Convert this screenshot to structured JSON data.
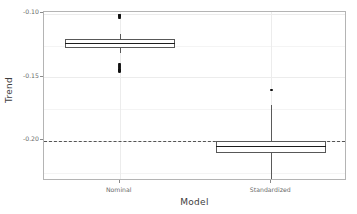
{
  "chart_data": {
    "type": "box",
    "title": "",
    "xlabel": "Model",
    "ylabel": "Trend",
    "categories": [
      "Nominal",
      "Standardized"
    ],
    "ylim": [
      -0.2315,
      -0.0985
    ],
    "yticks": [
      -0.1,
      -0.15,
      -0.2
    ],
    "ytick_labels": [
      "-0.10",
      "-0.15",
      "-0.20"
    ],
    "grid": true,
    "legend": "none",
    "reference_line": {
      "value": -0.2,
      "style": "dashed",
      "color": "#545454"
    },
    "boxes": [
      {
        "category": "Nominal",
        "lower_whisker": -0.1305,
        "q1": -0.1268,
        "median": -0.1233,
        "q3": -0.1195,
        "upper_whisker": -0.1155,
        "outliers": [
          -0.1008,
          -0.1012,
          -0.1018,
          -0.1025,
          -0.1032,
          -0.1395,
          -0.1402,
          -0.141,
          -0.1418,
          -0.1425,
          -0.1438,
          -0.1445,
          -0.1452
        ]
      },
      {
        "category": "Standardized",
        "lower_whisker": -0.2311,
        "q1": -0.2093,
        "median": -0.2045,
        "q3": -0.2,
        "upper_whisker": -0.1715,
        "outliers": [
          -0.16
        ]
      }
    ]
  },
  "axes": {
    "y_title": "Trend",
    "x_title": "Model",
    "y_tick_labels": [
      "-0.10",
      "-0.15",
      "-0.20"
    ],
    "x_tick_labels": [
      "Nominal",
      "Standardized"
    ]
  },
  "style": {
    "panel_background": "#ffffff",
    "panel_border": "#b4b4b4",
    "gridline_color": "#ececec",
    "box_border": "#585858",
    "median_color": "#1d1d1d",
    "outlier_color": "#111111",
    "reference_line_color": "#545454"
  }
}
